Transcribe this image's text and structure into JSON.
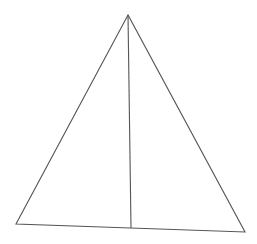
{
  "diagram": {
    "type": "triangle-with-altitude",
    "stroke_color": "#555555",
    "background": "#ffffff",
    "vertices": {
      "apex": [
        128,
        15
      ],
      "bottom_left": [
        16,
        224
      ],
      "bottom_right": [
        245,
        232
      ]
    },
    "altitude": {
      "from": [
        128,
        15
      ],
      "to": [
        131,
        228
      ]
    }
  }
}
